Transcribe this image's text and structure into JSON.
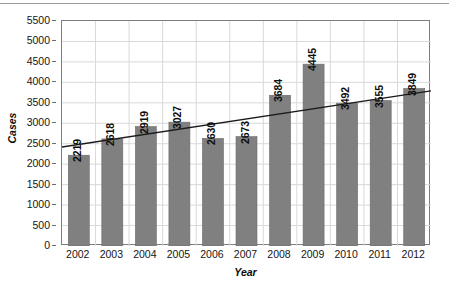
{
  "figure": {
    "background_color": "#ffffff",
    "top_rule_color": "#9a9a9a",
    "plot_border_color": "#7d7d7d",
    "gridline_color": "#d9d9d9",
    "bar_color": "#808080",
    "bar_edge_color": "#6b6b6b",
    "trendline_color": "#1a1a1a"
  },
  "chart_data": {
    "type": "bar",
    "title": "",
    "subtitle": "",
    "xlabel": "Year",
    "ylabel": "Cases",
    "categories": [
      "2002",
      "2003",
      "2004",
      "2005",
      "2006",
      "2007",
      "2008",
      "2009",
      "2010",
      "2011",
      "2012"
    ],
    "values": [
      2219,
      2618,
      2919,
      3027,
      2630,
      2673,
      3684,
      4445,
      3492,
      3555,
      3849
    ],
    "data_labels": [
      "2219",
      "2618",
      "2919",
      "3027",
      "2630",
      "2673",
      "3684",
      "4445",
      "3492",
      "3555",
      "3849"
    ],
    "data_label_orientation": "vertical",
    "ylim": [
      0,
      5500
    ],
    "ytick_step": 500,
    "ytick_labels": [
      "0",
      "500",
      "1000",
      "1500",
      "2000",
      "2500",
      "3000",
      "3500",
      "4000",
      "4500",
      "5000",
      "5500"
    ],
    "ytick_values": [
      0,
      500,
      1000,
      1500,
      2000,
      2500,
      3000,
      3500,
      4000,
      4500,
      5000,
      5500
    ],
    "grid": {
      "horizontal": true,
      "vertical": true
    },
    "legend": {
      "visible": false,
      "position": "none"
    },
    "series": [
      {
        "name": "Cases",
        "type": "bar",
        "values": [
          2219,
          2618,
          2919,
          3027,
          2630,
          2673,
          3684,
          4445,
          3492,
          3555,
          3849
        ]
      },
      {
        "name": "Linear trendline",
        "type": "line",
        "annotation": "straight trend line rising left-to-right across the plot",
        "start_value": 2420,
        "end_value": 3790
      }
    ]
  }
}
